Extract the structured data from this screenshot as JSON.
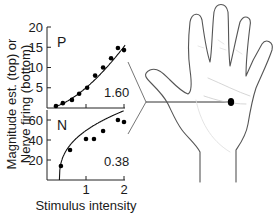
{
  "chart_data": [
    {
      "type": "scatter",
      "panel": "top",
      "panel_label": "P",
      "annotation": "1.60",
      "xlim": [
        0,
        2
      ],
      "ylim": [
        0,
        20
      ],
      "xticks": [
        1,
        2
      ],
      "yticks": [
        5,
        10,
        15,
        20
      ],
      "ytick_labels": [
        "5",
        "10",
        "15",
        "20"
      ],
      "points": [
        {
          "x": 0.21,
          "y": 0.5
        },
        {
          "x": 0.39,
          "y": 1.2
        },
        {
          "x": 0.63,
          "y": 2.0
        },
        {
          "x": 0.82,
          "y": 3.5
        },
        {
          "x": 1.03,
          "y": 5.0
        },
        {
          "x": 1.24,
          "y": 8.0
        },
        {
          "x": 1.45,
          "y": 10.0
        },
        {
          "x": 1.66,
          "y": 12.3
        },
        {
          "x": 1.84,
          "y": 14.8
        },
        {
          "x": 2.0,
          "y": 14.3
        }
      ],
      "fit": {
        "kind": "power",
        "exponent": 1.6,
        "coef": 5.0
      }
    },
    {
      "type": "scatter",
      "panel": "bottom",
      "panel_label": "N",
      "annotation": "0.38",
      "xlim": [
        0,
        2
      ],
      "ylim": [
        0,
        70
      ],
      "xticks": [
        1,
        2
      ],
      "xtick_labels": [
        "1",
        "2"
      ],
      "yticks": [
        20,
        40,
        60
      ],
      "ytick_labels": [
        "20",
        "40",
        "60"
      ],
      "points": [
        {
          "x": 0.34,
          "y": 14
        },
        {
          "x": 0.58,
          "y": 30
        },
        {
          "x": 1.0,
          "y": 41
        },
        {
          "x": 1.21,
          "y": 41
        },
        {
          "x": 1.45,
          "y": 49
        },
        {
          "x": 1.84,
          "y": 60
        },
        {
          "x": 2.0,
          "y": 58
        }
      ],
      "fit": {
        "kind": "power",
        "exponent": 0.38,
        "threshold": 0.3,
        "coef": 48
      }
    }
  ],
  "labels": {
    "ylabel_line1": "Magnitude est. (top) or",
    "ylabel_line2": "Nerve firing (bottom)",
    "xlabel": "Stimulus intensity"
  },
  "illustration": {
    "subject": "hand",
    "marker": "stimulus site on palm"
  }
}
